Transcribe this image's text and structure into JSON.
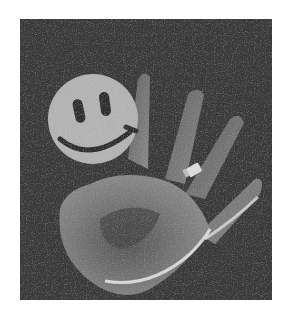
{
  "image": {
    "description": "Grayscale photograph of an open hand on a dark background with a yellow-style smiley face sticker on the palm area and a ring on the ring finger",
    "colors": {
      "background": "#3a3a3a",
      "hand": "#8a8a8a",
      "hand_highlight": "#d8d8d8",
      "smiley": "#b4b4b4",
      "smiley_features": "#2e2e2e",
      "page": "#ffffff"
    }
  }
}
